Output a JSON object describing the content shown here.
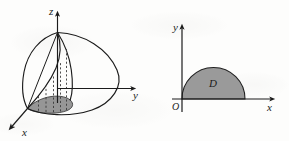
{
  "figure": {
    "caption": "",
    "background_color": "#fdfdfc",
    "ink_color": "#1b1b1b",
    "shade_color": "#969696",
    "shade_color_right": "#9a9a9a",
    "panels": [
      {
        "id": "left-panel",
        "kind": "3d-solid",
        "description": "Three-dimensional solid bounded above by a curved surface over a half-disk in the xy-plane, with dashed vertical lines from the shaded half-disk up to the surface.",
        "axes": [
          {
            "name": "z-axis",
            "label": "z",
            "direction": "up"
          },
          {
            "name": "y-axis",
            "label": "y",
            "direction": "right"
          },
          {
            "name": "x-axis",
            "label": "x",
            "direction": "lower-left"
          }
        ],
        "shaded_region": {
          "name": "projection-half-disk",
          "label": "",
          "fill": "#969696"
        },
        "dashed_lines_count": 5
      },
      {
        "id": "right-panel",
        "kind": "2d-plane-region",
        "description": "Plane region D: upper half-disk sitting on the x-axis with its left edge at the origin.",
        "axes": [
          {
            "name": "y-axis",
            "label": "y",
            "direction": "up"
          },
          {
            "name": "x-axis",
            "label": "x",
            "direction": "right"
          }
        ],
        "origin_label": "O",
        "shaded_region": {
          "name": "region-d",
          "label": "D",
          "fill": "#9a9a9a"
        }
      }
    ]
  },
  "labels": {
    "left": {
      "z": "z",
      "y": "y",
      "x": "x"
    },
    "right": {
      "y": "y",
      "x": "x",
      "origin": "O",
      "region": "D"
    }
  }
}
